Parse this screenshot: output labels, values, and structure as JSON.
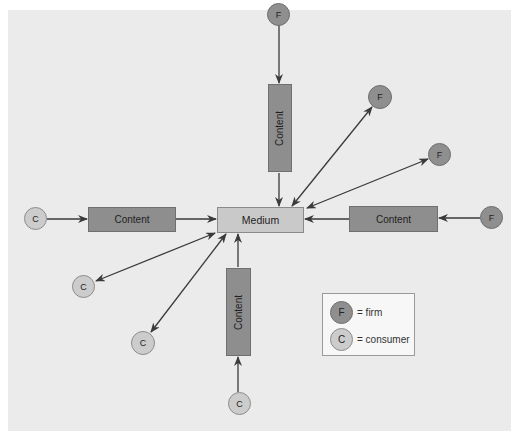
{
  "diagram": {
    "center": {
      "label": "Medium"
    },
    "content_boxes": [
      {
        "id": "top",
        "label": "Content",
        "orientation": "vertical"
      },
      {
        "id": "left",
        "label": "Content",
        "orientation": "horizontal"
      },
      {
        "id": "right",
        "label": "Content",
        "orientation": "horizontal"
      },
      {
        "id": "bottom",
        "label": "Content",
        "orientation": "vertical"
      }
    ],
    "nodes": [
      {
        "id": "firm-top",
        "type": "firm",
        "label": "F",
        "link": "via content, one-way to medium"
      },
      {
        "id": "firm-upper-right-1",
        "type": "firm",
        "label": "F",
        "link": "two-way with medium"
      },
      {
        "id": "firm-upper-right-2",
        "type": "firm",
        "label": "F",
        "link": "two-way with medium"
      },
      {
        "id": "firm-right",
        "type": "firm",
        "label": "F",
        "link": "via content, one-way to medium"
      },
      {
        "id": "consumer-left",
        "type": "consumer",
        "label": "C",
        "link": "via content, one-way to medium"
      },
      {
        "id": "consumer-lower-left-1",
        "type": "consumer",
        "label": "C",
        "link": "two-way with medium"
      },
      {
        "id": "consumer-lower-left-2",
        "type": "consumer",
        "label": "C",
        "link": "two-way with medium"
      },
      {
        "id": "consumer-bottom",
        "type": "consumer",
        "label": "C",
        "link": "via content, one-way to medium"
      }
    ],
    "legend": {
      "items": [
        {
          "symbol": "F",
          "text": "= firm"
        },
        {
          "symbol": "C",
          "text": "= consumer"
        }
      ]
    },
    "colors": {
      "background": "#ebebeb",
      "firm": "#8f8f8f",
      "consumer": "#cccccc",
      "content": "#8e8e8e",
      "medium": "#c9c9c9",
      "arrow": "#3a3a3a"
    }
  }
}
